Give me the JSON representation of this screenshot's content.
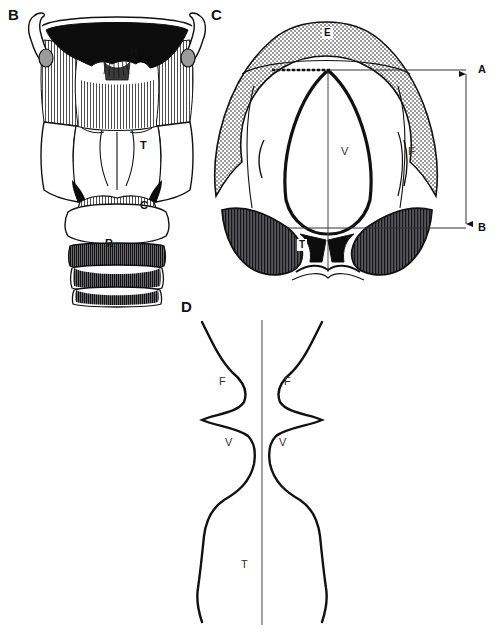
{
  "figure": {
    "background_color": "#ffffff",
    "ink_color": "#111111"
  },
  "panels": [
    {
      "id": "B",
      "letter": "B",
      "title": "Posterior view of the laryngeal skeleton",
      "labels": [
        {
          "key": "H",
          "text": "H",
          "meaning": "hyoid-bone",
          "x": 136,
          "y": 52
        },
        {
          "key": "T",
          "text": "T",
          "meaning": "thyroid-cartilage",
          "x": 145,
          "y": 145
        },
        {
          "key": "C",
          "text": "C",
          "meaning": "cricoid-cartilage",
          "x": 145,
          "y": 205
        },
        {
          "key": "R",
          "text": "R",
          "meaning": "tracheal-rings",
          "x": 110,
          "y": 243
        }
      ]
    },
    {
      "id": "C",
      "letter": "C",
      "title": "Superior laryngoscopic view of the larynx",
      "labels": [
        {
          "key": "E",
          "text": "E",
          "meaning": "epiglottis",
          "x": 328,
          "y": 33
        },
        {
          "key": "V",
          "text": "V",
          "meaning": "vestibule-glottis",
          "x": 345,
          "y": 152
        },
        {
          "key": "F",
          "text": "F",
          "meaning": "false-vocal-cord",
          "x": 411,
          "y": 152
        },
        {
          "key": "T",
          "text": "T",
          "meaning": "arytenoid-thyroid-mass",
          "x": 302,
          "y": 245
        }
      ],
      "dimension_markers": [
        {
          "key": "A",
          "text": "A",
          "meaning": "superior-reference-level",
          "y": 70
        },
        {
          "key": "B",
          "text": "B",
          "meaning": "inferior-reference-level",
          "y": 228
        }
      ]
    },
    {
      "id": "D",
      "letter": "D",
      "title": "Coronal outline of the laryngeal lumen",
      "labels": [
        {
          "key": "F-left",
          "text": "F",
          "meaning": "false-vocal-cord-left",
          "x": 223,
          "y": 382
        },
        {
          "key": "F-right",
          "text": "F",
          "meaning": "false-vocal-cord-right",
          "x": 288,
          "y": 382
        },
        {
          "key": "V-left",
          "text": "V",
          "meaning": "vocal-cord-left",
          "x": 229,
          "y": 443
        },
        {
          "key": "V-right",
          "text": "V",
          "meaning": "vocal-cord-right",
          "x": 283,
          "y": 443
        },
        {
          "key": "T",
          "text": "T",
          "meaning": "trachea",
          "x": 245,
          "y": 565
        }
      ]
    }
  ],
  "panel_letters": {
    "B": {
      "text": "B",
      "x": 8,
      "y": 8
    },
    "C": {
      "text": "C",
      "x": 211,
      "y": 8
    },
    "D": {
      "text": "D",
      "x": 181,
      "y": 300
    }
  }
}
